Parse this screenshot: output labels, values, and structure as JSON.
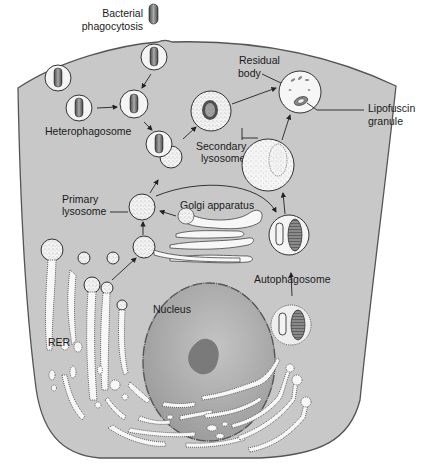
{
  "colors": {
    "background": "#ffffff",
    "cytoplasm": "#c8c8c8",
    "cell_outline": "#555555",
    "nucleus": "#a9a9a9",
    "nucleolus": "#7a7a7a",
    "vesicle_fill": "#f4f4f4",
    "text": "#1a1a1a"
  },
  "labels": {
    "bacterial_phagocytosis_line1": "Bacterial",
    "bacterial_phagocytosis_line2": "phagocytosis",
    "heterophagosome": "Heterophagosome",
    "residual_body_line1": "Residual",
    "residual_body_line2": "body",
    "lipofuscin_line1": "Lipofuscin",
    "lipofuscin_line2": "granule",
    "secondary_lysosome_line1": "Secondary",
    "secondary_lysosome_line2": "lysosome",
    "primary_lysosome_line1": "Primary",
    "primary_lysosome_line2": "lysosome",
    "golgi_apparatus": "Golgi apparatus",
    "autophagosome": "Autophagosome",
    "nucleus": "Nucleus",
    "rer": "RER"
  },
  "structures": [
    "cell-membrane",
    "bacterium",
    "phagocytic-invagination",
    "heterophagosome",
    "secondary-lysosome",
    "residual-body",
    "lipofuscin-granule",
    "primary-lysosome",
    "golgi-apparatus",
    "autophagosome",
    "mitochondrion",
    "nucleus",
    "nucleolus",
    "rough-endoplasmic-reticulum"
  ]
}
